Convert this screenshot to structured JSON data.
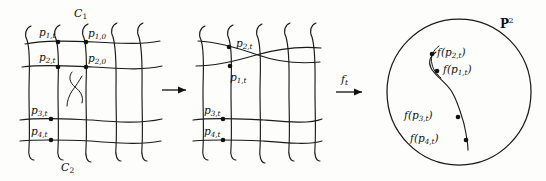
{
  "figure": {
    "type": "mathematical-diagram",
    "background_color": "#fdfdfc",
    "ink_color": "#1a1a1a"
  },
  "panel_source": {
    "name": "source-grid",
    "curve_labels": {
      "top": "C",
      "top_sub": "1",
      "bottom": "C",
      "bottom_sub": "2"
    },
    "points": [
      {
        "id": "p1t",
        "base": "p",
        "sub": "1,t",
        "x": 39,
        "y": 33
      },
      {
        "id": "p10",
        "base": "p",
        "sub": "1,0",
        "x": 84,
        "y": 33
      },
      {
        "id": "p2t",
        "base": "p",
        "sub": "2,t",
        "x": 39,
        "y": 58
      },
      {
        "id": "p20",
        "base": "p",
        "sub": "2,0",
        "x": 84,
        "y": 58
      },
      {
        "id": "p3t",
        "base": "p",
        "sub": "3,t",
        "x": 32,
        "y": 116
      },
      {
        "id": "p4t",
        "base": "p",
        "sub": "4,t",
        "x": 32,
        "y": 137
      }
    ]
  },
  "panel_deformed": {
    "name": "deformed-grid",
    "points": [
      {
        "id": "p2t",
        "base": "p",
        "sub": "2,t",
        "x": 131,
        "y": 43
      },
      {
        "id": "p1t",
        "base": "p",
        "sub": "1,t",
        "x": 131,
        "y": 63
      },
      {
        "id": "p3t",
        "base": "p",
        "sub": "3,t",
        "x": 125,
        "y": 116
      },
      {
        "id": "p4t",
        "base": "p",
        "sub": "4,t",
        "x": 125,
        "y": 137
      }
    ]
  },
  "panel_image": {
    "name": "projective-plane",
    "space_label": {
      "symbol": "P",
      "superscript": "2"
    },
    "points": [
      {
        "id": "fp2t",
        "label": "f(p",
        "sub": "2,t",
        "close": ")"
      },
      {
        "id": "fp1t",
        "label": "f(p",
        "sub": "1,t",
        "close": ")"
      },
      {
        "id": "fp3t",
        "label": "f(p",
        "sub": "3,t",
        "close": ")"
      },
      {
        "id": "fp4t",
        "label": "f(p",
        "sub": "4,t",
        "close": ")"
      }
    ]
  },
  "arrows": [
    {
      "id": "arrow-1",
      "label": "",
      "sub": ""
    },
    {
      "id": "arrow-2",
      "label": "f",
      "sub": "t"
    }
  ]
}
